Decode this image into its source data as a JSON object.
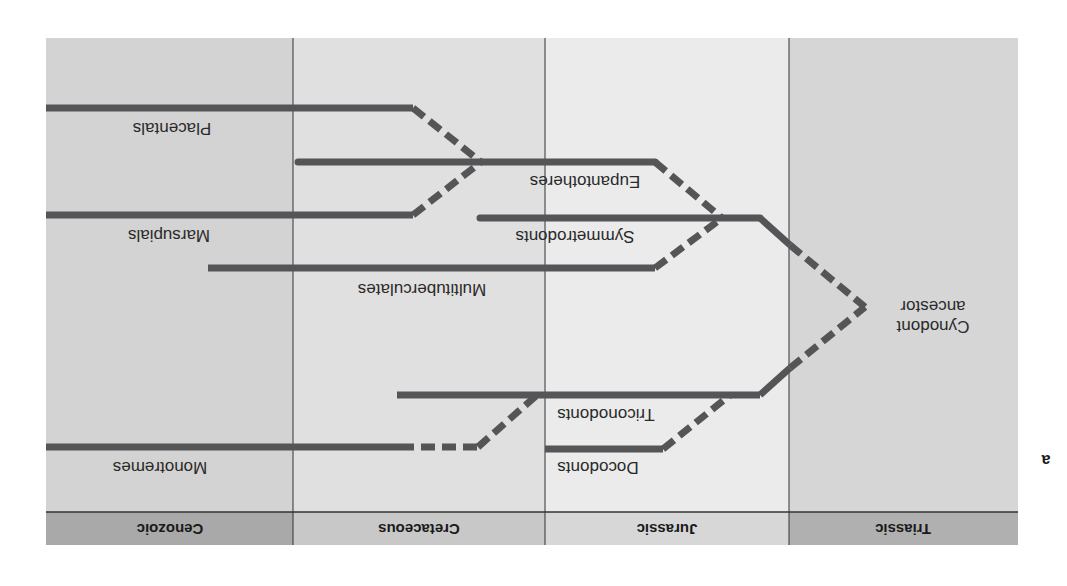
{
  "figure": {
    "panel_letter": "a",
    "orientation": "rotated-180",
    "colors": {
      "cenozoic_bg": "#d3d3d3",
      "cretaceous_bg": "#e0e0e0",
      "jurassic_bg": "#ebebeb",
      "triassic_bg": "#d6d6d6",
      "header_bg_dark": "#a9a9a9",
      "header_bg_light": "#d2d2d2",
      "lineage": "#555558",
      "divider": "#333333"
    }
  },
  "periods": [
    {
      "name": "Cenozoic"
    },
    {
      "name": "Cretaceous"
    },
    {
      "name": "Jurassic"
    },
    {
      "name": "Triassic"
    }
  ],
  "ancestor": {
    "line1": "Cynodont",
    "line2": "ancestor"
  },
  "lineages": [
    {
      "name": "Placentals"
    },
    {
      "name": "Eupantotheres"
    },
    {
      "name": "Marsupials"
    },
    {
      "name": "Symmetrodonts"
    },
    {
      "name": "Multituberculates"
    },
    {
      "name": "Triconodonts"
    },
    {
      "name": "Monotremes"
    },
    {
      "name": "Docodonts"
    }
  ]
}
